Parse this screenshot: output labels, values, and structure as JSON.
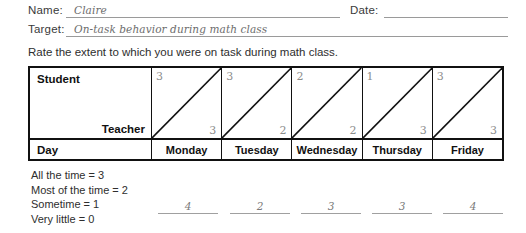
{
  "form": {
    "name_label": "Name:",
    "name_value": "Claire",
    "date_label": "Date:",
    "date_value": "",
    "target_label": "Target:",
    "target_value": "On-task behavior during math class"
  },
  "instruction": "Rate the extent to which you were on task during math class.",
  "table": {
    "student_label": "Student",
    "teacher_label": "Teacher",
    "day_label": "Day",
    "days": [
      "Monday",
      "Tuesday",
      "Wednesday",
      "Thursday",
      "Friday"
    ],
    "student_ratings": [
      "3",
      "3",
      "2",
      "1",
      "3"
    ],
    "teacher_ratings": [
      "3",
      "2",
      "2",
      "3",
      "3"
    ]
  },
  "legend": [
    "All the time = 3",
    "Most of the time = 2",
    "Sometime = 1",
    "Very little = 0"
  ],
  "totals": [
    "4",
    "2",
    "3",
    "3",
    "4"
  ],
  "colors": {
    "border": "#111111",
    "rule": "#9a9a9a",
    "handwriting": "#6d6d6d"
  }
}
